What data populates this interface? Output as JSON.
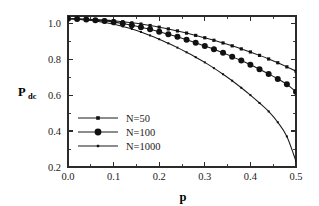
{
  "chart_data": {
    "type": "line",
    "title": "",
    "xlabel": "p",
    "ylabel": "P",
    "ylabel_subscript": "dc",
    "xlim": [
      0.0,
      0.5
    ],
    "ylim": [
      0.2,
      1.04
    ],
    "grid": false,
    "legend_position": "lower-left-inside",
    "x_ticks": [
      "0.0",
      "0.1",
      "0.2",
      "0.3",
      "0.4",
      "0.5"
    ],
    "x_tick_values": [
      0.0,
      0.1,
      0.2,
      0.3,
      0.4,
      0.5
    ],
    "x_minor_tick_values": [
      0.05,
      0.15,
      0.25,
      0.35,
      0.45
    ],
    "y_ticks": [
      "0.2",
      "0.4",
      "0.6",
      "0.8",
      "1.0"
    ],
    "y_tick_values": [
      0.2,
      0.4,
      0.6,
      0.8,
      1.0
    ],
    "y_minor_tick_values": [
      0.3,
      0.5,
      0.7,
      0.9
    ],
    "series": [
      {
        "name": "N=50",
        "marker": "small-dot",
        "marker_size": 1.6,
        "x": [
          0.0,
          0.02,
          0.04,
          0.06,
          0.08,
          0.1,
          0.12,
          0.14,
          0.16,
          0.18,
          0.2,
          0.22,
          0.24,
          0.26,
          0.28,
          0.3,
          0.32,
          0.34,
          0.36,
          0.38,
          0.4,
          0.42,
          0.44,
          0.46,
          0.48,
          0.5
        ],
        "values": [
          1.025,
          1.024,
          1.022,
          1.02,
          1.017,
          1.013,
          1.008,
          1.002,
          0.995,
          0.987,
          0.978,
          0.968,
          0.957,
          0.945,
          0.932,
          0.919,
          0.905,
          0.89,
          0.874,
          0.857,
          0.84,
          0.821,
          0.801,
          0.78,
          0.757,
          0.733
        ]
      },
      {
        "name": "N=100",
        "marker": "filled-circle",
        "marker_size": 3.0,
        "x": [
          0.0,
          0.02,
          0.04,
          0.06,
          0.08,
          0.1,
          0.12,
          0.14,
          0.16,
          0.18,
          0.2,
          0.22,
          0.24,
          0.26,
          0.28,
          0.3,
          0.32,
          0.34,
          0.36,
          0.38,
          0.4,
          0.42,
          0.44,
          0.46,
          0.48,
          0.5
        ],
        "values": [
          1.025,
          1.023,
          1.021,
          1.017,
          1.012,
          1.006,
          0.998,
          0.989,
          0.978,
          0.966,
          0.953,
          0.939,
          0.924,
          0.908,
          0.891,
          0.873,
          0.855,
          0.835,
          0.814,
          0.792,
          0.769,
          0.744,
          0.718,
          0.69,
          0.66,
          0.618
        ]
      },
      {
        "name": "N=1000",
        "marker": "tiny-dot",
        "marker_size": 1.0,
        "x": [
          0.0,
          0.02,
          0.04,
          0.06,
          0.08,
          0.1,
          0.12,
          0.14,
          0.16,
          0.18,
          0.2,
          0.22,
          0.24,
          0.26,
          0.28,
          0.3,
          0.32,
          0.34,
          0.36,
          0.38,
          0.4,
          0.42,
          0.44,
          0.46,
          0.48,
          0.5
        ],
        "values": [
          1.025,
          1.022,
          1.018,
          1.012,
          1.004,
          0.994,
          0.982,
          0.968,
          0.951,
          0.932,
          0.911,
          0.888,
          0.864,
          0.838,
          0.811,
          0.782,
          0.75,
          0.716,
          0.68,
          0.641,
          0.6,
          0.556,
          0.509,
          0.449,
          0.37,
          0.232
        ]
      }
    ],
    "legend_entries": [
      {
        "label": "N=50",
        "marker": "small-dot"
      },
      {
        "label": "N=100",
        "marker": "filled-circle"
      },
      {
        "label": "N=1000",
        "marker": "tiny-dot"
      }
    ],
    "colors": {
      "curve": "#1a1a1a",
      "axis": "#2b2b2b",
      "background": "#ffffff"
    }
  }
}
